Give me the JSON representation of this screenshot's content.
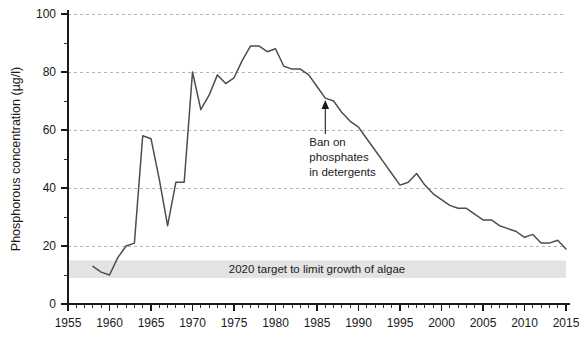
{
  "chart_data": {
    "type": "line",
    "title": "",
    "xlabel": "",
    "ylabel": "Phosphorous concentration (µg/l)",
    "xlim": [
      1955,
      2015
    ],
    "ylim": [
      0,
      100
    ],
    "grid": true,
    "legend": "none",
    "x_ticks": [
      1955,
      1960,
      1965,
      1970,
      1975,
      1980,
      1985,
      1990,
      1995,
      2000,
      2005,
      2010,
      2015
    ],
    "x_minor_tick_step": 1,
    "y_ticks": [
      0,
      20,
      40,
      60,
      80,
      100
    ],
    "y_minor_tick_step": 5,
    "series": [
      {
        "name": "Phosphorous concentration",
        "color": "#4d4d4d",
        "x": [
          1958,
          1959,
          1960,
          1961,
          1962,
          1963,
          1964,
          1965,
          1966,
          1967,
          1968,
          1969,
          1970,
          1971,
          1972,
          1973,
          1974,
          1975,
          1976,
          1977,
          1978,
          1979,
          1980,
          1981,
          1982,
          1983,
          1984,
          1985,
          1986,
          1987,
          1988,
          1989,
          1990,
          1991,
          1992,
          1993,
          1994,
          1995,
          1996,
          1997,
          1998,
          1999,
          2000,
          2001,
          2002,
          2003,
          2004,
          2005,
          2006,
          2007,
          2008,
          2009,
          2010,
          2011,
          2012,
          2013,
          2014,
          2015
        ],
        "y": [
          13,
          11,
          10,
          16,
          20,
          21,
          58,
          57,
          43,
          27,
          42,
          42,
          80,
          67,
          72,
          79,
          76,
          78,
          84,
          89,
          89,
          87,
          88,
          82,
          81,
          81,
          79,
          75,
          71,
          70,
          66,
          63,
          61,
          57,
          53,
          49,
          45,
          41,
          42,
          45,
          41,
          38,
          36,
          34,
          33,
          33,
          31,
          29,
          29,
          27,
          26,
          25,
          23,
          24,
          21,
          21,
          22,
          19
        ]
      }
    ],
    "bands": [
      {
        "name": "target-band",
        "label": "2020 target to limit growth of algae",
        "y_min": 9,
        "y_max": 15,
        "color": "#e3e3e3"
      }
    ],
    "annotations": [
      {
        "name": "ban-on-phosphates",
        "lines": [
          "Ban on",
          "phosphates",
          "in detergents"
        ],
        "point_x": 1986,
        "point_y": 71
      }
    ]
  }
}
